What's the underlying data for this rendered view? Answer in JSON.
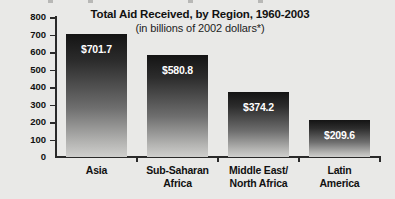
{
  "chart_data": {
    "type": "bar",
    "title": "Total Aid Received, by Region, 1960-2003",
    "subtitle": "(in billions of 2002 dollars*)",
    "xlabel": "",
    "ylabel": "",
    "ylim": [
      0,
      800
    ],
    "grid": false,
    "legend": "none",
    "orientation": "vertical",
    "y_ticks": [
      "800",
      "700",
      "600",
      "500",
      "400",
      "300",
      "200",
      "100",
      "0"
    ],
    "y_tick_values": [
      800,
      700,
      600,
      500,
      400,
      300,
      200,
      100,
      0
    ],
    "categories": [
      "Asia",
      "Sub-Saharan Africa",
      "Middle East/ North Africa",
      "Latin America"
    ],
    "category_lines": [
      [
        "Asia"
      ],
      [
        "Sub-Saharan",
        "Africa"
      ],
      [
        "Middle East/",
        "North Africa"
      ],
      [
        "Latin",
        "America"
      ]
    ],
    "values": [
      701.7,
      580.8,
      374.2,
      209.6
    ],
    "value_labels": [
      "$701.7",
      "$580.8",
      "$374.2",
      "$209.6"
    ],
    "colors": {
      "bar_top": "#141414",
      "bar_bottom": "#cfcfcd",
      "background": "#e9e9e7",
      "axis": "#2a2a2a",
      "text": "#111111",
      "value_text": "#ffffff"
    }
  }
}
